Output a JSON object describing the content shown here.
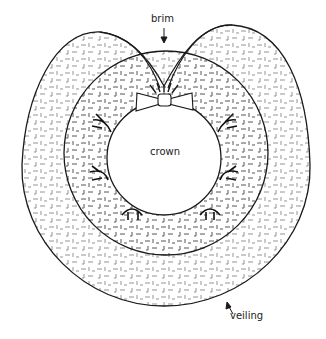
{
  "diagram": {
    "labels": {
      "brim": "brim",
      "crown": "crown",
      "veiling": "veiling"
    },
    "colors": {
      "line": "#1a1a1a",
      "texture": "#6a6a6a",
      "background": "#ffffff"
    }
  }
}
